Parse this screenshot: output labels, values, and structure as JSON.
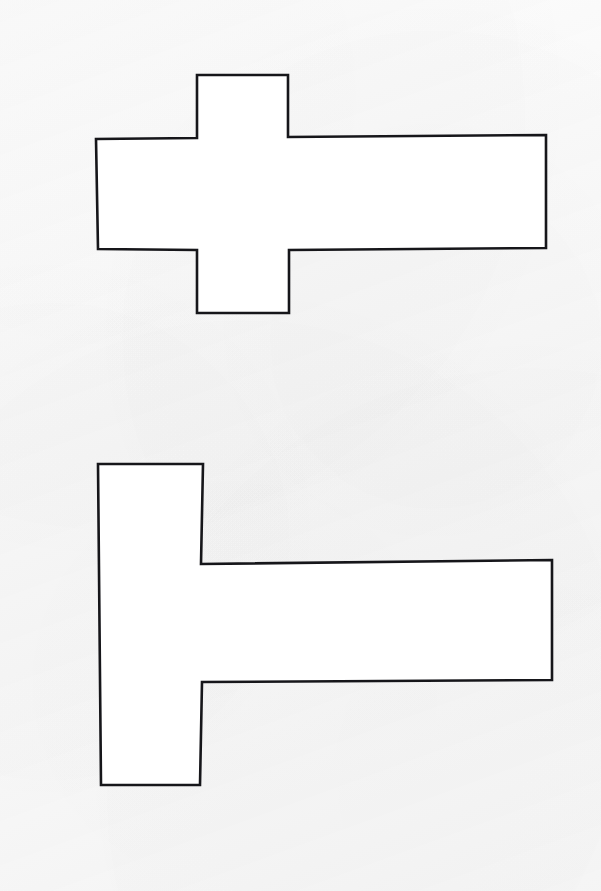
{
  "page": {
    "background_color": "#fbfbfb",
    "width": 601,
    "height": 891,
    "medium": "scanned line drawing on white paper"
  },
  "style": {
    "stroke_color": "#16161a",
    "fill_color": "#ffffff",
    "stroke_width": 2.6
  },
  "figures": [
    {
      "id": "figure-1",
      "name": "cross-shape-with-long-right-arm",
      "description": "Plus/cross shaped rectilinear polygon whose right arm is elongated into a long horizontal bar",
      "vertex_count": 12,
      "bounding_box": {
        "x": 96,
        "y": 75,
        "width": 450,
        "height": 238
      },
      "points": "197,75 288,75 288,137 546,135 546,248 289,250 289,313 197,313 197,250 98,249 96,139 197,138"
    },
    {
      "id": "figure-2",
      "name": "t-shape-rotated-left-stem",
      "description": "T shaped rectilinear polygon: tall vertical bar on the left with a long horizontal arm extending to the right from its middle",
      "vertex_count": 8,
      "bounding_box": {
        "x": 98,
        "y": 464,
        "width": 454,
        "height": 321
      },
      "points": "98,464 203,464 201,564 552,560 552,680 202,682 200,785 101,785"
    }
  ]
}
